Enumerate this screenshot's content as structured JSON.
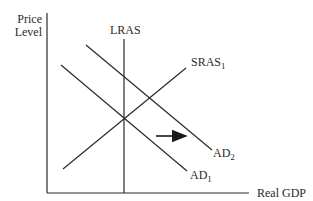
{
  "diagram": {
    "y_axis_label_line1": "Price",
    "y_axis_label_line2": "Level",
    "x_axis_label": "Real GDP",
    "curves": {
      "lras": {
        "label": "LRAS",
        "sub": ""
      },
      "sras": {
        "label": "SRAS",
        "sub": "1"
      },
      "ad1": {
        "label": "AD",
        "sub": "1"
      },
      "ad2": {
        "label": "AD",
        "sub": "2"
      }
    },
    "shift_arrow": "rightward shift from AD1 to AD2",
    "line_color": "#2a2a2a"
  }
}
